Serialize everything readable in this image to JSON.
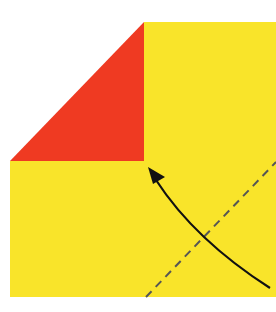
{
  "diagram": {
    "type": "origami-fold-step",
    "colors": {
      "background": "#ffffff",
      "paper_front": "#f9e42a",
      "paper_back": "#ef3a22",
      "arrow": "#111111",
      "fold_line": "#555555"
    },
    "elements": [
      {
        "name": "paper-square",
        "shape": "square",
        "color": "yellow"
      },
      {
        "name": "folded-corner",
        "shape": "triangle",
        "color": "red"
      },
      {
        "name": "valley-fold-line",
        "style": "dashed"
      },
      {
        "name": "fold-arrow",
        "style": "curved",
        "direction": "toward upper-left"
      }
    ]
  }
}
